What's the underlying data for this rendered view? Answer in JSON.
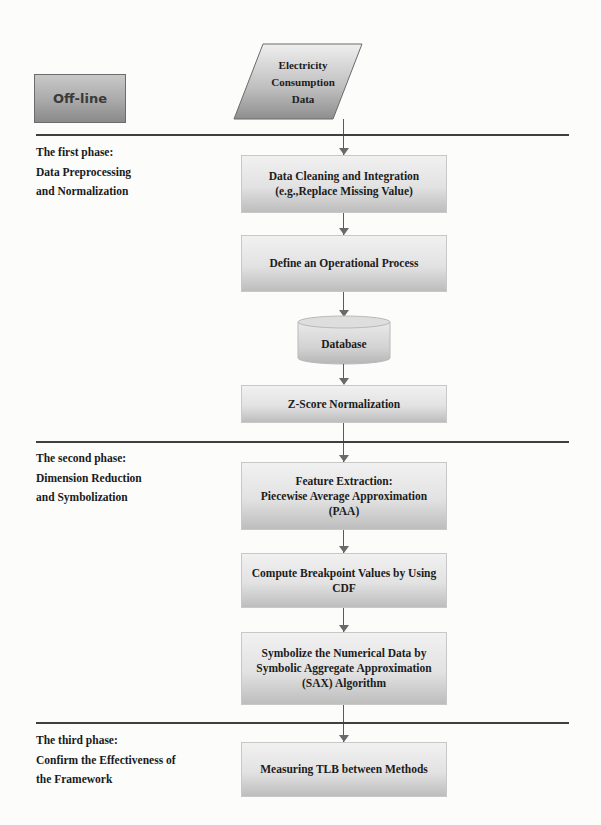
{
  "diagram": {
    "context_label": "Off-line",
    "input": {
      "shape": "parallelogram",
      "label": "Electricity\nConsumption\nData"
    },
    "phases": [
      {
        "label": "The first phase:\nData Preprocessing\nand Normalization",
        "steps": [
          {
            "shape": "rectangle",
            "label": "Data Cleaning and Integration\n(e.g.,Replace Missing Value)"
          },
          {
            "shape": "rectangle",
            "label": "Define an Operational Process"
          },
          {
            "shape": "cylinder",
            "label": "Database"
          },
          {
            "shape": "rectangle",
            "label": "Z-Score Normalization"
          }
        ]
      },
      {
        "label": "The second phase:\nDimension Reduction\nand Symbolization",
        "steps": [
          {
            "shape": "rectangle",
            "label": "Feature Extraction:\nPiecewise Average Approximation\n(PAA)"
          },
          {
            "shape": "rectangle",
            "label": "Compute Breakpoint Values by Using\nCDF"
          },
          {
            "shape": "rectangle",
            "label": "Symbolize the Numerical Data by\nSymbolic Aggregate Approximation\n(SAX) Algorithm"
          }
        ]
      },
      {
        "label": "The third phase:\nConfirm the Effectiveness of\nthe Framework",
        "steps": [
          {
            "shape": "rectangle",
            "label": "Measuring TLB between Methods"
          }
        ]
      }
    ],
    "colors": {
      "box_fill_top": "#f1f1f1",
      "box_fill_bottom": "#bdbdbd",
      "offline_fill": "#a9a9a9",
      "divider": "#3f3f3f",
      "connector": "#5a5a5a"
    }
  }
}
